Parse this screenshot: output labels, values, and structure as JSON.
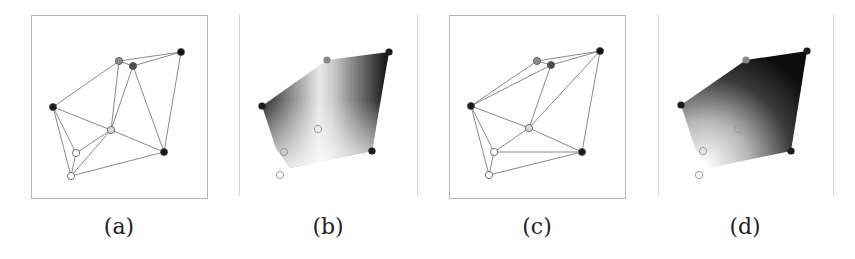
{
  "figure": {
    "panels": [
      {
        "id": "a",
        "caption": "(a)",
        "type": "triangulation",
        "frame": {
          "x": 31,
          "y": 15,
          "w": 176,
          "h": 183
        },
        "vertices": [
          {
            "id": "v1",
            "x": 53,
            "y": 107,
            "fill": "#1a1a1a"
          },
          {
            "id": "v2",
            "x": 119,
            "y": 61,
            "fill": "#8c8c8c"
          },
          {
            "id": "v3",
            "x": 133,
            "y": 66,
            "fill": "#4d4d4d"
          },
          {
            "id": "v4",
            "x": 181,
            "y": 52,
            "fill": "#111111"
          },
          {
            "id": "v5",
            "x": 164,
            "y": 152,
            "fill": "#1a1a1a"
          },
          {
            "id": "v6",
            "x": 111,
            "y": 130,
            "fill": "#d9d9d9"
          },
          {
            "id": "v7",
            "x": 76,
            "y": 153,
            "fill": "#ffffff"
          },
          {
            "id": "v8",
            "x": 71,
            "y": 176,
            "fill": "#ffffff"
          }
        ],
        "edges": [
          [
            "v1",
            "v2"
          ],
          [
            "v2",
            "v3"
          ],
          [
            "v2",
            "v4"
          ],
          [
            "v3",
            "v4"
          ],
          [
            "v4",
            "v5"
          ],
          [
            "v3",
            "v5"
          ],
          [
            "v2",
            "v6"
          ],
          [
            "v3",
            "v6"
          ],
          [
            "v1",
            "v6"
          ],
          [
            "v6",
            "v5"
          ],
          [
            "v1",
            "v7"
          ],
          [
            "v1",
            "v8"
          ],
          [
            "v7",
            "v6"
          ],
          [
            "v7",
            "v8"
          ],
          [
            "v8",
            "v6"
          ],
          [
            "v8",
            "v5"
          ]
        ]
      },
      {
        "id": "b",
        "caption": "(b)",
        "type": "interpolated-field",
        "guides": [
          239,
          417
        ],
        "hull": [
          [
            262,
            106
          ],
          [
            327,
            60
          ],
          [
            389,
            52
          ],
          [
            372,
            151
          ],
          [
            290,
            168
          ],
          [
            276,
            148
          ]
        ],
        "gradient": {
          "direction": "horizontal",
          "stops": [
            "#2a2a2a",
            "#f2f2f2",
            "#101010"
          ]
        },
        "markers": [
          {
            "x": 262,
            "y": 106,
            "style": "dark"
          },
          {
            "x": 327,
            "y": 60,
            "style": "gray"
          },
          {
            "x": 389,
            "y": 52,
            "style": "dark"
          },
          {
            "x": 372,
            "y": 151,
            "style": "dark"
          },
          {
            "x": 318,
            "y": 129,
            "style": "ring"
          },
          {
            "x": 284,
            "y": 152,
            "style": "ring"
          },
          {
            "x": 280,
            "y": 175,
            "style": "ring"
          }
        ]
      },
      {
        "id": "c",
        "caption": "(c)",
        "type": "triangulation",
        "frame": {
          "x": 449,
          "y": 15,
          "w": 176,
          "h": 183
        },
        "vertices": [
          {
            "id": "v1",
            "x": 471,
            "y": 106,
            "fill": "#1a1a1a"
          },
          {
            "id": "v2",
            "x": 537,
            "y": 61,
            "fill": "#8c8c8c"
          },
          {
            "id": "v3",
            "x": 551,
            "y": 65,
            "fill": "#4d4d4d"
          },
          {
            "id": "v4",
            "x": 600,
            "y": 51,
            "fill": "#111111"
          },
          {
            "id": "v5",
            "x": 582,
            "y": 152,
            "fill": "#1a1a1a"
          },
          {
            "id": "v6",
            "x": 529,
            "y": 128,
            "fill": "#d9d9d9"
          },
          {
            "id": "v7",
            "x": 494,
            "y": 152,
            "fill": "#ffffff"
          },
          {
            "id": "v8",
            "x": 489,
            "y": 175,
            "fill": "#ffffff"
          }
        ],
        "edges": [
          [
            "v1",
            "v2"
          ],
          [
            "v1",
            "v3"
          ],
          [
            "v2",
            "v3"
          ],
          [
            "v2",
            "v4"
          ],
          [
            "v3",
            "v4"
          ],
          [
            "v4",
            "v5"
          ],
          [
            "v4",
            "v6"
          ],
          [
            "v3",
            "v6"
          ],
          [
            "v1",
            "v6"
          ],
          [
            "v6",
            "v5"
          ],
          [
            "v1",
            "v7"
          ],
          [
            "v1",
            "v8"
          ],
          [
            "v7",
            "v6"
          ],
          [
            "v7",
            "v5"
          ],
          [
            "v7",
            "v8"
          ],
          [
            "v8",
            "v5"
          ]
        ]
      },
      {
        "id": "d",
        "caption": "(d)",
        "type": "interpolated-field",
        "guides": [
          658,
          833
        ],
        "hull": [
          [
            681,
            105
          ],
          [
            746,
            60
          ],
          [
            807,
            51
          ],
          [
            791,
            151
          ],
          [
            709,
            168
          ],
          [
            695,
            148
          ]
        ],
        "gradient": {
          "direction": "radial",
          "stops": [
            "#f4f4f4",
            "#7a7a7a",
            "#111111"
          ]
        },
        "markers": [
          {
            "x": 681,
            "y": 105,
            "style": "dark"
          },
          {
            "x": 746,
            "y": 60,
            "style": "gray"
          },
          {
            "x": 807,
            "y": 51,
            "style": "dark"
          },
          {
            "x": 791,
            "y": 151,
            "style": "dark"
          },
          {
            "x": 738,
            "y": 129,
            "style": "ring"
          },
          {
            "x": 703,
            "y": 151,
            "style": "ring"
          },
          {
            "x": 699,
            "y": 175,
            "style": "ring"
          }
        ]
      }
    ],
    "colors": {
      "edge": "#8a8a8a",
      "frame": "#b5b5b5",
      "guide": "#d8d8d8",
      "ring": "#9a9a9a"
    }
  }
}
